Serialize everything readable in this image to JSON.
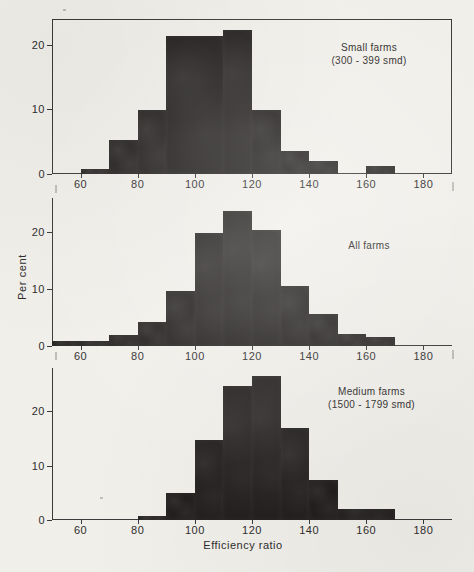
{
  "figure": {
    "xlabel": "Efficiency ratio",
    "ylabel": "Per cent",
    "xticks": [
      "60",
      "80",
      "100",
      "120",
      "140",
      "160",
      "180"
    ],
    "yticks": [
      "0",
      "10",
      "20"
    ],
    "ink_color": "#221f1e",
    "paper_color": "#f1efea",
    "axis_color": "#3a3a3a"
  },
  "panels": [
    {
      "note_line1": "Small farms",
      "note_line2": "(300 - 399 smd)",
      "note": "Small farms\n(300 - 399 smd)"
    },
    {
      "note_line1": "All farms",
      "note_line2": "",
      "note": "All farms"
    },
    {
      "note_line1": "Medium farms",
      "note_line2": "(1500 - 1799 smd)",
      "note": "Medium farms\n(1500 - 1799 smd)"
    }
  ],
  "chart_data": [
    {
      "type": "bar",
      "title": "Small farms (300 - 399 smd)",
      "xlabel": "Efficiency ratio",
      "ylabel": "Per cent",
      "xlim": [
        50,
        190
      ],
      "ylim": [
        0,
        24
      ],
      "xticks": [
        60,
        80,
        100,
        120,
        140,
        160,
        180
      ],
      "yticks": [
        0,
        10,
        20
      ],
      "grid": false,
      "legend": "none",
      "bin_edges": [
        60,
        70,
        80,
        90,
        110,
        120,
        130,
        150,
        160,
        170
      ],
      "bins": [
        {
          "x0": 60,
          "x1": 70,
          "value": 0.8
        },
        {
          "x0": 70,
          "x1": 80,
          "value": 5.3
        },
        {
          "x0": 80,
          "x1": 90,
          "value": 9.9
        },
        {
          "x0": 90,
          "x1": 110,
          "value": 21.4
        },
        {
          "x0": 110,
          "x1": 120,
          "value": 22.3
        },
        {
          "x0": 120,
          "x1": 130,
          "value": 9.9
        },
        {
          "x0": 130,
          "x1": 140,
          "value": 3.6
        },
        {
          "x0": 140,
          "x1": 150,
          "value": 2.0
        },
        {
          "x0": 150,
          "x1": 160,
          "value": 0.0
        },
        {
          "x0": 160,
          "x1": 170,
          "value": 1.3
        }
      ]
    },
    {
      "type": "bar",
      "title": "All farms",
      "xlabel": "Efficiency ratio",
      "ylabel": "Per cent",
      "xlim": [
        50,
        190
      ],
      "ylim": [
        0,
        26
      ],
      "xticks": [
        60,
        80,
        100,
        120,
        140,
        160,
        180
      ],
      "yticks": [
        0,
        10,
        20
      ],
      "grid": false,
      "legend": "none",
      "bins": [
        {
          "x0": 50,
          "x1": 60,
          "value": 0.8
        },
        {
          "x0": 60,
          "x1": 70,
          "value": 0.9
        },
        {
          "x0": 70,
          "x1": 80,
          "value": 2.0
        },
        {
          "x0": 80,
          "x1": 90,
          "value": 4.3
        },
        {
          "x0": 90,
          "x1": 100,
          "value": 9.6
        },
        {
          "x0": 100,
          "x1": 110,
          "value": 19.9
        },
        {
          "x0": 110,
          "x1": 120,
          "value": 23.8
        },
        {
          "x0": 120,
          "x1": 130,
          "value": 20.3
        },
        {
          "x0": 130,
          "x1": 140,
          "value": 10.6
        },
        {
          "x0": 140,
          "x1": 150,
          "value": 5.6
        },
        {
          "x0": 150,
          "x1": 160,
          "value": 2.1
        },
        {
          "x0": 160,
          "x1": 170,
          "value": 1.6
        }
      ]
    },
    {
      "type": "bar",
      "title": "Medium farms (1500 - 1799 smd)",
      "xlabel": "Efficiency ratio",
      "ylabel": "Per cent",
      "xlim": [
        50,
        190
      ],
      "ylim": [
        0,
        28
      ],
      "xticks": [
        60,
        80,
        100,
        120,
        140,
        160,
        180
      ],
      "yticks": [
        0,
        10,
        20
      ],
      "grid": false,
      "legend": "none",
      "bins": [
        {
          "x0": 80,
          "x1": 90,
          "value": 0.7
        },
        {
          "x0": 90,
          "x1": 100,
          "value": 4.9
        },
        {
          "x0": 100,
          "x1": 110,
          "value": 14.8
        },
        {
          "x0": 110,
          "x1": 120,
          "value": 24.6
        },
        {
          "x0": 120,
          "x1": 130,
          "value": 26.5
        },
        {
          "x0": 130,
          "x1": 140,
          "value": 17.0
        },
        {
          "x0": 140,
          "x1": 150,
          "value": 7.4
        },
        {
          "x0": 150,
          "x1": 170,
          "value": 2.0
        }
      ]
    }
  ]
}
